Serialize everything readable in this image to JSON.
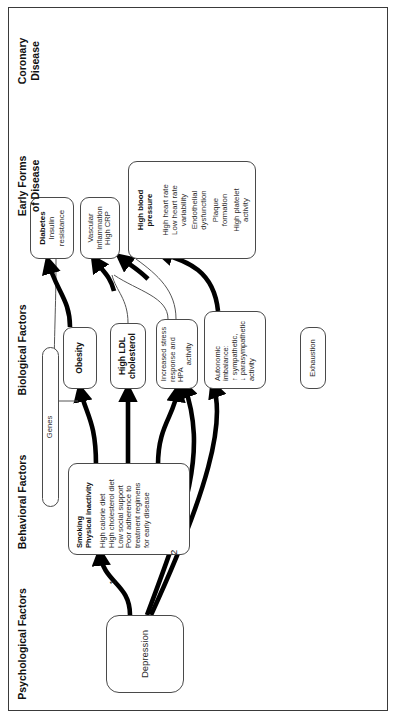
{
  "figure": {
    "orientation": "landscape-rotated-90ccw"
  },
  "columns": [
    {
      "id": "psychological",
      "label": "Psychological  Factors"
    },
    {
      "id": "behavioral",
      "label": "Behavioral Factors"
    },
    {
      "id": "biological",
      "label": "Biological Factors"
    },
    {
      "id": "early",
      "label": "Early Forms\nof Disease"
    },
    {
      "id": "coronary",
      "label": "Coronary\nDisease"
    }
  ],
  "column_labels": {
    "psychological": "Psychological  Factors",
    "behavioral": "Behavioral Factors",
    "biological": "Biological Factors",
    "early_l1": "Early Forms",
    "early_l2": "of Disease",
    "coronary_l1": "Coronary",
    "coronary_l2": "Disease"
  },
  "nodes": {
    "depression": {
      "heading": "",
      "lines": [
        "Depression"
      ]
    },
    "behavior": {
      "heading_l1": "Smoking",
      "heading_l2": "Physical inactivity",
      "lines": [
        "High calorie diet",
        "High cholesterol diet",
        "Low social support",
        "Poor adherence to",
        "treatment regimens",
        "for early disease"
      ]
    },
    "genes": {
      "heading": "",
      "lines": [
        "Genes"
      ]
    },
    "obesity": {
      "heading": "Obesity",
      "lines": []
    },
    "ldl": {
      "heading_l1": "High LDL",
      "heading_l2": "cholesterol",
      "lines": []
    },
    "stress": {
      "heading": "",
      "lines": [
        "Increased stress",
        "response and HPA",
        "activity"
      ]
    },
    "autonomic": {
      "heading": "",
      "lines": [
        "Autonomic",
        "imbalance:",
        "↑ sympathetic,",
        "↓ parasympathetic",
        "activity"
      ]
    },
    "exhaustion": {
      "heading": "",
      "lines": [
        "Exhaustion"
      ]
    },
    "diabetes": {
      "heading": "Diabetes",
      "lines": [
        "Insulin",
        "resistance"
      ]
    },
    "vascular": {
      "heading": "",
      "lines": [
        "Vascular",
        "Inflammation",
        "High CRP"
      ]
    },
    "bp": {
      "heading_l1": "High blood",
      "heading_l2": "pressure",
      "lines": [
        "High heart rate",
        "Low heart rate",
        "variability",
        "Endothelial",
        "dysfunction",
        "Plaque",
        "formation",
        "High platelet",
        "activity"
      ]
    }
  },
  "arrow_labels": {
    "one": "1",
    "two": "2"
  },
  "colors": {
    "stroke": "#4a4a4a",
    "arrow": "#000000",
    "thin_arrow": "#555555",
    "text": "#111111",
    "background": "#ffffff"
  }
}
